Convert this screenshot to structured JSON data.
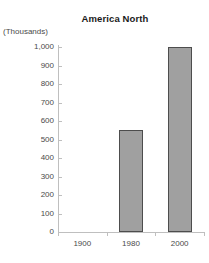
{
  "chart_data": {
    "type": "bar",
    "title": "America North",
    "xlabel": "",
    "ylabel": "(Thousands)",
    "categories": [
      "1900",
      "1980",
      "2000"
    ],
    "values": [
      0,
      550,
      1000
    ],
    "ylim": [
      0,
      1000
    ],
    "yticks": [
      0,
      100,
      200,
      300,
      400,
      500,
      600,
      700,
      800,
      900,
      1000
    ],
    "ytick_labels": [
      "0",
      "100",
      "200",
      "300",
      "400",
      "500",
      "600",
      "700",
      "800",
      "900",
      "1,000"
    ],
    "grid": false,
    "legend": false,
    "series": [
      {
        "name": "America North",
        "values": [
          0,
          550,
          1000
        ]
      }
    ],
    "colors": {
      "bar_fill": "#a0a0a0",
      "bar_border": "#4d4d4d",
      "axis": "#bfbfbf",
      "text": "#4a4a4a",
      "title": "#1a1a1a",
      "background": "#ffffff"
    }
  }
}
